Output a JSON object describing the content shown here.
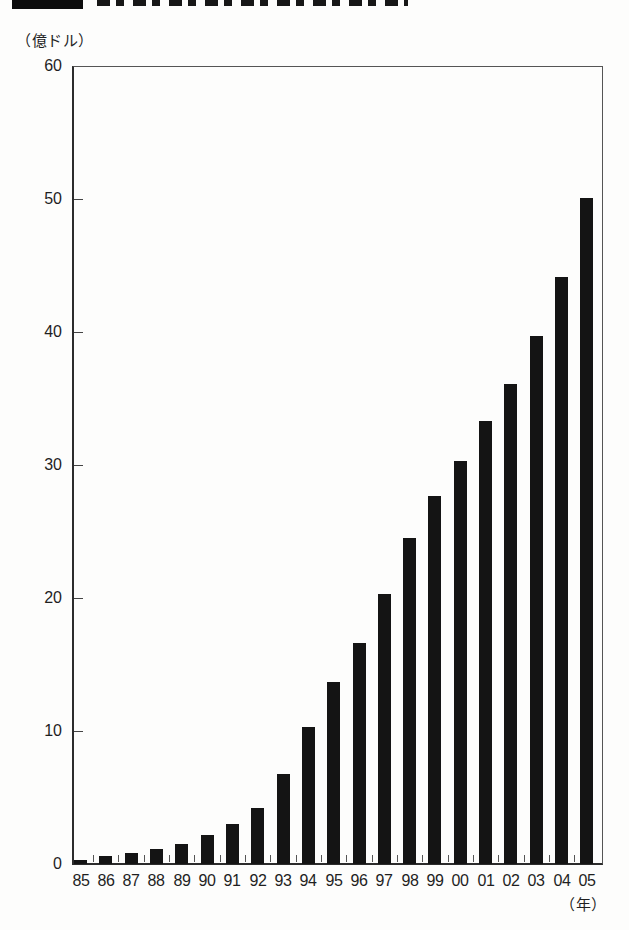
{
  "chart_data": {
    "type": "bar",
    "categories": [
      "85",
      "86",
      "87",
      "88",
      "89",
      "90",
      "91",
      "92",
      "93",
      "94",
      "95",
      "96",
      "97",
      "98",
      "99",
      "00",
      "01",
      "02",
      "03",
      "04",
      "05"
    ],
    "values": [
      0.3,
      0.6,
      0.8,
      1.1,
      1.5,
      2.2,
      3.0,
      4.2,
      6.8,
      10.3,
      13.7,
      16.6,
      20.3,
      24.5,
      27.7,
      30.3,
      33.3,
      36.1,
      39.7,
      44.1,
      50.1
    ],
    "ylabel": "（億ドル）",
    "xlabel": "（年）",
    "ylim": [
      0,
      60
    ],
    "yticks": [
      0,
      10,
      20,
      30,
      40,
      50,
      60
    ],
    "bar_color": "#141414",
    "grid": false,
    "legend": "none",
    "orientation": "vertical"
  }
}
